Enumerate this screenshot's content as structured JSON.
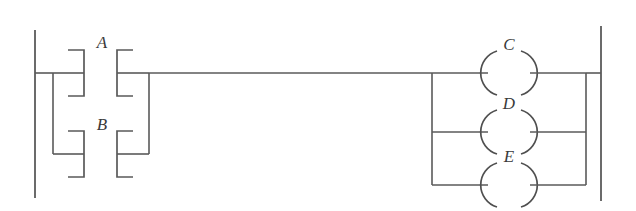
{
  "diagram": {
    "kind": "ladder-logic-rung",
    "title": "",
    "colors": {
      "background": "#ffffff",
      "wire": "#5a5a5a",
      "rail": "#6b6b6b",
      "label": "#3a3a3a"
    },
    "rails": {
      "left": {
        "name": "left-power-rail",
        "x": 35,
        "y1": 30,
        "y2": 198
      },
      "right": {
        "name": "right-power-rail",
        "x": 601,
        "y1": 26,
        "y2": 201
      }
    },
    "inputs": {
      "group_name": "parallel-contact-branch",
      "contacts": [
        {
          "id": "A",
          "label": "A",
          "type": "normally-open-contact",
          "row": 1,
          "y": 73,
          "label_x": 102,
          "label_y": 48
        },
        {
          "id": "B",
          "label": "B",
          "type": "normally-open-contact",
          "row": 2,
          "y": 154,
          "label_x": 102,
          "label_y": 130
        }
      ]
    },
    "outputs": {
      "group_name": "parallel-coil-branch",
      "coils": [
        {
          "id": "C",
          "label": "C",
          "type": "output-coil",
          "row": 1,
          "y": 73,
          "label_x": 509,
          "label_y": 50
        },
        {
          "id": "D",
          "label": "D",
          "type": "output-coil",
          "row": 2,
          "y": 132,
          "label_x": 509,
          "label_y": 109
        },
        {
          "id": "E",
          "label": "E",
          "type": "output-coil",
          "row": 3,
          "y": 185,
          "label_x": 509,
          "label_y": 162
        }
      ]
    },
    "connections": {
      "main_rung_y": 73,
      "input_branch_left_x": 53,
      "input_branch_right_x": 149,
      "output_branch_left_x": 432,
      "output_branch_right_x": 586
    }
  }
}
